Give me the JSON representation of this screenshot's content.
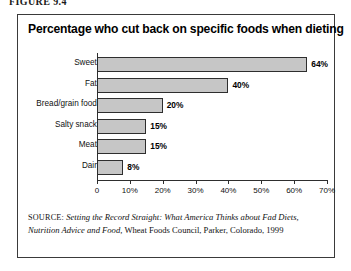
{
  "figure": {
    "caption": "FIGURE 9.4"
  },
  "chart_data": {
    "type": "bar",
    "orientation": "horizontal",
    "title": "Percentage who cut back on specific foods when dieting",
    "xlabel": "",
    "ylabel": "",
    "categories": [
      "Sweets",
      "Fats",
      "Bread/grain foods",
      "Salty snacks",
      "Meats",
      "Dairy"
    ],
    "values": [
      64,
      40,
      20,
      15,
      15,
      8
    ],
    "value_labels": [
      "64%",
      "40%",
      "20%",
      "15%",
      "15%",
      "8%"
    ],
    "xlim": [
      0,
      70
    ],
    "tick_values": [
      0,
      10,
      20,
      30,
      40,
      50,
      60,
      70
    ],
    "tick_labels": [
      "0",
      "10%",
      "20%",
      "30%",
      "40%",
      "50%",
      "60%",
      "70%"
    ],
    "grid": false,
    "legend": null,
    "bar_color": "#c6c6c6",
    "bar_border_color": "#2e2e2e"
  },
  "source": {
    "label": "SOURCE:",
    "title": "Setting the Record Straight: What America Thinks about Fad Diets, Nutrition Advice and Food,",
    "publisher": "Wheat Foods Council, Parker, Colorado, 1999"
  }
}
